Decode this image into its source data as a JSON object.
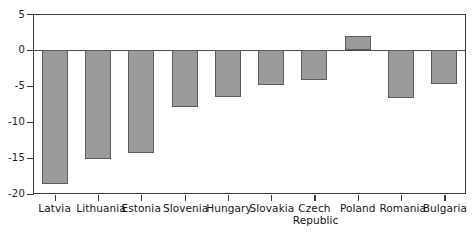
{
  "chart_data": {
    "type": "bar",
    "title": "",
    "subtitle": "",
    "xlabel": "",
    "ylabel": "",
    "categories": [
      "Latvia",
      "Lithuania",
      "Estonia",
      "Slovenia",
      "Hungary",
      "Slovakia",
      "Czech\nRepublic",
      "Poland",
      "Romania",
      "Bulgaria"
    ],
    "values": [
      -18.6,
      -15.2,
      -14.3,
      -7.9,
      -6.5,
      -4.8,
      -4.2,
      1.9,
      -6.6,
      -4.7
    ],
    "ylim": [
      -20,
      5
    ],
    "yticks": [
      5,
      0,
      -5,
      -10,
      -15,
      -20
    ],
    "ytick_labels": [
      "5",
      "0",
      "-5",
      "-10",
      "-15",
      "-20"
    ],
    "grid": false,
    "legend": false,
    "bar_fill": "#9b9b9b",
    "bar_stroke": "#5d5d5d",
    "axis_color": "#3a3a3a",
    "background": "#ffffff"
  }
}
